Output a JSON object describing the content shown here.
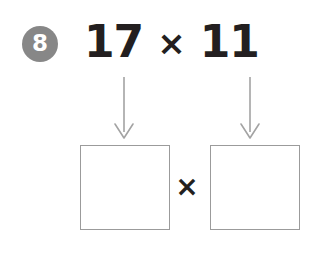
{
  "worksheet": {
    "background_color": "#ffffff",
    "question_number": "8",
    "badge_color": "#878787",
    "badge_text_color": "#ffffff",
    "ink_color": "#231f20",
    "arrow_color": "#a3a3a3",
    "box_border_color": "#9b9b9b",
    "problem": {
      "left_operand": "17",
      "operator": "×",
      "right_operand": "11"
    },
    "arrows": {
      "left_label": "arrow-down-to-left-box",
      "right_label": "arrow-down-to-right-box"
    },
    "answer_area": {
      "left_box_value": "",
      "right_box_value": "",
      "operator": "×"
    }
  }
}
